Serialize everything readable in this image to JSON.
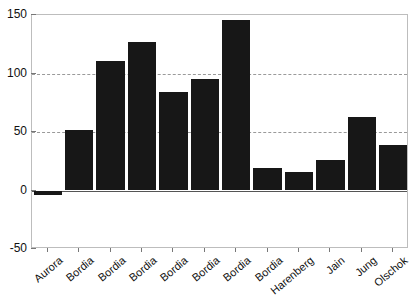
{
  "chart_data": {
    "type": "bar",
    "title": "",
    "xlabel": "",
    "ylabel": "",
    "ylim": [
      -50,
      150
    ],
    "yticks": [
      150,
      100,
      50,
      0,
      -50
    ],
    "gridlines": [
      100,
      50
    ],
    "grid": true,
    "legend": null,
    "bar_color": "#171717",
    "categories": [
      "Aurora",
      "Bordia",
      "Bordia",
      "Bordia",
      "Bordia",
      "Bordia",
      "Bordia",
      "Bordia",
      "Harenberg",
      "Jain",
      "Jung",
      "Olschok"
    ],
    "values": [
      -4,
      52,
      111,
      127,
      84,
      95,
      146,
      19,
      16,
      26,
      63,
      39
    ]
  },
  "axes": {
    "y_tick_labels": [
      "150",
      "100",
      "50",
      "0",
      "-50"
    ],
    "x_tick_labels": [
      "Aurora",
      "Bordia",
      "Bordia",
      "Bordia",
      "Bordia",
      "Bordia",
      "Bordia",
      "Bordia",
      "Harenberg",
      "Jain",
      "Jung",
      "Olschok"
    ]
  },
  "colors": {
    "bar": "#171717",
    "grid": "#9a9a9a",
    "frame": "#bdbdbd",
    "axis_text": "#111111",
    "background": "#ffffff"
  }
}
